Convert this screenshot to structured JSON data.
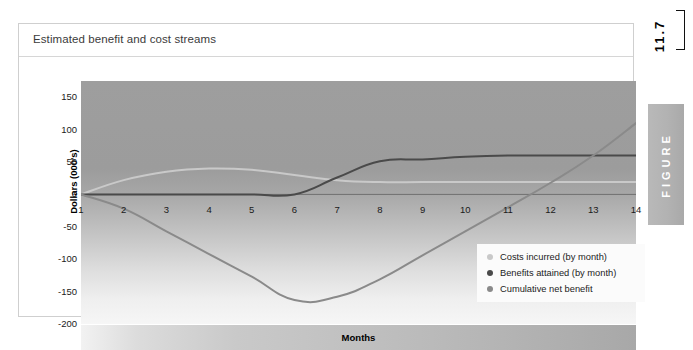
{
  "figure": {
    "number": "11.7",
    "word": "FIGURE"
  },
  "chart": {
    "title": "Estimated benefit and cost streams"
  },
  "legend": [
    {
      "label": "Costs incurred (by month)",
      "color": "#c9c9c9",
      "key": "costs"
    },
    {
      "label": "Benefits attained (by month)",
      "color": "#4a4a4a",
      "key": "benefits"
    },
    {
      "label": "Cumulative net benefit",
      "color": "#8a8a8a",
      "key": "cumulative"
    }
  ],
  "chart_data": {
    "type": "line",
    "title": "Estimated benefit and cost streams",
    "xlabel": "Months",
    "ylabel": "Dollars (000's)",
    "x": [
      1,
      2,
      3,
      4,
      5,
      6,
      7,
      8,
      9,
      10,
      11,
      12,
      13,
      14
    ],
    "xlim": [
      1,
      14
    ],
    "ylim": [
      -200,
      175
    ],
    "yticks": [
      150,
      100,
      50,
      0,
      -50,
      -100,
      -150,
      -200
    ],
    "xticks": [
      "1",
      "2",
      "3",
      "4",
      "5",
      "6",
      "7",
      "8",
      "9",
      "10",
      "11",
      "12",
      "13",
      "14"
    ],
    "grid": false,
    "legend_position": "inside-lower-right",
    "series": [
      {
        "name": "Costs incurred (by month)",
        "color": "#c9c9c9",
        "values": [
          0,
          22,
          35,
          40,
          38,
          30,
          22,
          19,
          19,
          19,
          19,
          19,
          19,
          19
        ]
      },
      {
        "name": "Benefits attained (by month)",
        "color": "#4a4a4a",
        "values": [
          0,
          0,
          0,
          0,
          0,
          0,
          26,
          51,
          54,
          58,
          60,
          60,
          60,
          60
        ]
      },
      {
        "name": "Cumulative net benefit",
        "color": "#8a8a8a",
        "values": [
          0,
          -22,
          -57,
          -92,
          -127,
          -163,
          -158,
          -131,
          -94,
          -57,
          -20,
          18,
          60,
          110
        ]
      }
    ]
  }
}
